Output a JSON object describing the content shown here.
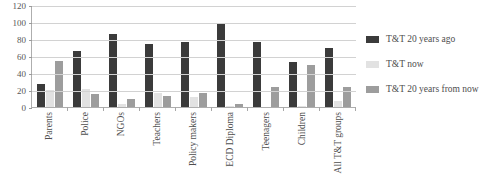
{
  "chart_data": {
    "type": "bar",
    "title": "",
    "subtitle": "",
    "xlabel": "",
    "ylabel": "",
    "ylim": [
      0,
      120
    ],
    "ytick_step": 20,
    "yticks": [
      0,
      20,
      40,
      60,
      80,
      100,
      120
    ],
    "ytick_labels": [
      "0",
      "20",
      "40",
      "60",
      "80",
      "100",
      "120"
    ],
    "grid": "horizontal",
    "legend_position": "right",
    "categories": [
      "Parents",
      "Police",
      "NGOs",
      "Teachers",
      "Policy makers",
      "ECD Diploma",
      "Teenagers",
      "Children",
      "All T&T groups"
    ],
    "series": [
      {
        "name": "T&T 20 years ago",
        "color": "#3b3b3b",
        "values": [
          27,
          66,
          86,
          74,
          77,
          98,
          77,
          53,
          70
        ]
      },
      {
        "name": "T&T now",
        "color": "#e2e2e2",
        "values": [
          20,
          21,
          3,
          16,
          12,
          1,
          0,
          1,
          7
        ]
      },
      {
        "name": "T&T 20 years from now",
        "color": "#9d9d9d",
        "values": [
          54,
          15,
          10,
          13,
          16,
          3,
          23,
          49,
          24
        ]
      }
    ]
  },
  "legend": {
    "items": [
      {
        "label": "T&T 20 years ago",
        "swatch": "dark-swatch-icon"
      },
      {
        "label": "T&T now",
        "swatch": "light-swatch-icon"
      },
      {
        "label": "T&T 20 years from now",
        "swatch": "medium-swatch-icon"
      }
    ]
  },
  "colors": {
    "series_20_years_ago": "#3b3b3b",
    "series_now": "#e2e2e2",
    "series_20_years_from_now": "#9d9d9d",
    "gridline": "#d2d2d2",
    "axis": "#aeaeae",
    "text": "#4e4e4e",
    "background": "#ffffff"
  }
}
